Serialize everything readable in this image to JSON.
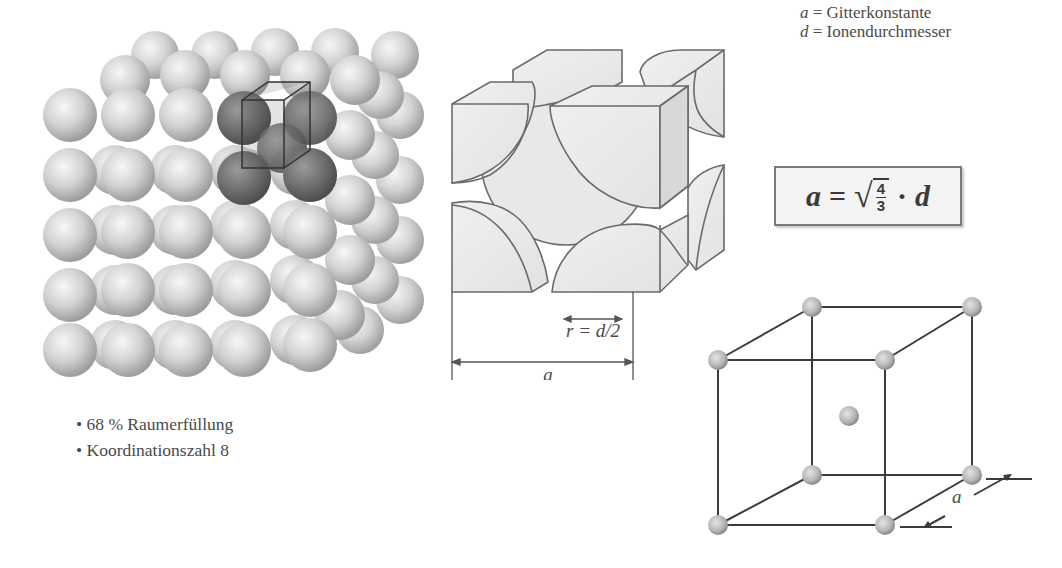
{
  "legend": {
    "items": [
      {
        "symbol": "a",
        "equals": "=",
        "text": "Gitterkonstante"
      },
      {
        "symbol": "d",
        "equals": "=",
        "text": "Ionendurchmesser"
      }
    ]
  },
  "properties": {
    "items": [
      "68 % Raumerfüllung",
      "Koordinationszahl 8"
    ]
  },
  "formula": {
    "lhs": "a",
    "equals": "=",
    "fraction_numerator": "4",
    "fraction_denominator": "3",
    "operator": "·",
    "rhs": "d"
  },
  "unit_cell_cut": {
    "radius_label": "r = d/2",
    "edge_label": "a"
  },
  "bcc_cube": {
    "edge_label": "a",
    "atom_color": "#b9b9b9",
    "line_color": "#3c3c3c"
  },
  "sphere_pack": {
    "sphere_color": "#cfcfcf",
    "highlight_color": "#6b6b6b"
  }
}
